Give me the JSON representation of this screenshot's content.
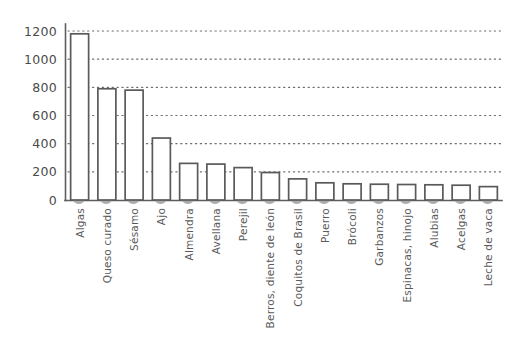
{
  "chart_data": {
    "type": "bar",
    "title": "",
    "subtitle": "",
    "xlabel": "",
    "ylabel": "",
    "ylim": [
      0,
      1280
    ],
    "yticks": [
      0,
      200,
      400,
      600,
      800,
      1000,
      1200
    ],
    "ytick_labels": [
      "0",
      "200",
      "400",
      "600",
      "800",
      "1000",
      "1200"
    ],
    "grid": true,
    "grid_axis": "y",
    "grid_style": "dotted",
    "legend": false,
    "legend_position": "none",
    "orientation": "vertical",
    "bar_style": "outlined-with-grey-fill",
    "categories": [
      "Algas",
      "Queso curado",
      "Sésamo",
      "Ajo",
      "Almendra",
      "Avellana",
      "Perejil",
      "Berros, diente de león",
      "Coquitos de Brasil",
      "Puerro",
      "Brócoli",
      "Garbanzos",
      "Espinacas, hinojo",
      "Alubias",
      "Acelgas",
      "Leche de vaca"
    ],
    "values": [
      1180,
      790,
      780,
      440,
      260,
      255,
      230,
      195,
      150,
      122,
      115,
      112,
      110,
      108,
      105,
      95
    ],
    "xtick_rotation": 90
  },
  "style": {
    "background": "#ffffff",
    "bar_fill": "#ababab",
    "bar_stroke": "#5a5a5a",
    "axis_color": "#5e5e5e",
    "grid_color": "#6d6d6d",
    "ytick_color": "#4a4a4a",
    "xtick_color": "#5a5a5a"
  }
}
